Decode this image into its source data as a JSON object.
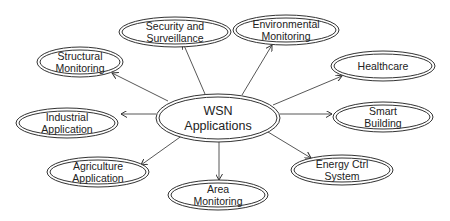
{
  "diagram": {
    "type": "hub-and-spoke",
    "colors": {
      "stroke": "#333333",
      "text": "#222222",
      "background": "#ffffff"
    },
    "center": {
      "id": "wsn",
      "lines": [
        "WSN",
        "Applications"
      ],
      "cx": 218,
      "cy": 118,
      "rx": 62,
      "ry": 24
    },
    "nodes": [
      {
        "id": "security",
        "lines": [
          "Security and",
          "Surveillance"
        ],
        "cx": 175,
        "cy": 32,
        "rx": 56,
        "ry": 15
      },
      {
        "id": "environmental",
        "lines": [
          "Environmental",
          "Monitoring"
        ],
        "cx": 286,
        "cy": 30,
        "rx": 53,
        "ry": 15
      },
      {
        "id": "structural",
        "lines": [
          "Structural",
          "Monitoring"
        ],
        "cx": 80,
        "cy": 62,
        "rx": 43,
        "ry": 15
      },
      {
        "id": "healthcare",
        "lines": [
          "Healthcare"
        ],
        "cx": 383,
        "cy": 66,
        "rx": 52,
        "ry": 15
      },
      {
        "id": "industrial",
        "lines": [
          "Industrial",
          "Application"
        ],
        "cx": 67,
        "cy": 123,
        "rx": 51,
        "ry": 15
      },
      {
        "id": "smart-building",
        "lines": [
          "Smart",
          "Building"
        ],
        "cx": 383,
        "cy": 117,
        "rx": 50,
        "ry": 15
      },
      {
        "id": "agriculture",
        "lines": [
          "Agriculture",
          "Application"
        ],
        "cx": 98,
        "cy": 172,
        "rx": 51,
        "ry": 15
      },
      {
        "id": "energy",
        "lines": [
          "Energy Ctrl",
          "System"
        ],
        "cx": 342,
        "cy": 170,
        "rx": 51,
        "ry": 15
      },
      {
        "id": "area",
        "lines": [
          "Area",
          "Monitoring"
        ],
        "cx": 218,
        "cy": 195,
        "rx": 50,
        "ry": 15
      }
    ],
    "edges": [
      {
        "from": "wsn",
        "to": "security",
        "x1": 205,
        "y1": 94,
        "x2": 183,
        "y2": 43
      },
      {
        "from": "wsn",
        "to": "environmental",
        "x1": 242,
        "y1": 95,
        "x2": 272,
        "y2": 45
      },
      {
        "from": "wsn",
        "to": "structural",
        "x1": 168,
        "y1": 101,
        "x2": 112,
        "y2": 73
      },
      {
        "from": "wsn",
        "to": "healthcare",
        "x1": 273,
        "y1": 105,
        "x2": 342,
        "y2": 76
      },
      {
        "from": "wsn",
        "to": "industrial",
        "x1": 156,
        "y1": 114,
        "x2": 121,
        "y2": 114
      },
      {
        "from": "wsn",
        "to": "smart-building",
        "x1": 280,
        "y1": 114,
        "x2": 332,
        "y2": 114
      },
      {
        "from": "wsn",
        "to": "agriculture",
        "x1": 183,
        "y1": 135,
        "x2": 141,
        "y2": 165
      },
      {
        "from": "wsn",
        "to": "energy",
        "x1": 268,
        "y1": 132,
        "x2": 311,
        "y2": 158
      },
      {
        "from": "wsn",
        "to": "area",
        "x1": 219,
        "y1": 142,
        "x2": 219,
        "y2": 180
      }
    ]
  }
}
